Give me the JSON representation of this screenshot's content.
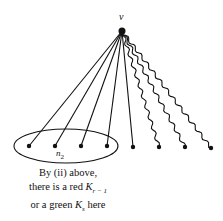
{
  "diagram": {
    "apex_label": "v",
    "apex": {
      "x": 122,
      "y": 31
    },
    "leaves": [
      {
        "x": 29,
        "y": 146,
        "edge": "straight"
      },
      {
        "x": 55,
        "y": 146,
        "edge": "straight"
      },
      {
        "x": 81,
        "y": 146,
        "edge": "straight"
      },
      {
        "x": 107,
        "y": 146,
        "edge": "straight"
      },
      {
        "x": 133,
        "y": 147,
        "edge": "straight"
      },
      {
        "x": 159,
        "y": 147,
        "edge": "wavy"
      },
      {
        "x": 185,
        "y": 147,
        "edge": "wavy"
      },
      {
        "x": 211,
        "y": 148,
        "edge": "wavy"
      }
    ],
    "group_label": "n",
    "group_label_sub": "2",
    "caption": {
      "line1": "By (ii) above,",
      "line2_prefix": "there is a red ",
      "line2_math": "K",
      "line2_sub": "r − 1",
      "line3_prefix": "or a green ",
      "line3_math": "K",
      "line3_sub": "s",
      "line3_suffix": " here"
    },
    "colors": {
      "ink": "#111111",
      "background": "#ffffff"
    }
  }
}
